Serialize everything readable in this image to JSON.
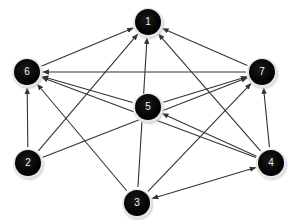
{
  "diagram": {
    "type": "directed-graph",
    "colors": {
      "node_fill": "#000000",
      "node_label": "#ffffff",
      "node_ring": "#e0e0e0",
      "edge": "#333333",
      "background": "#ffffff"
    },
    "nodes": [
      {
        "id": "1",
        "label": "1",
        "x": 148,
        "y": 22
      },
      {
        "id": "2",
        "label": "2",
        "x": 28,
        "y": 163
      },
      {
        "id": "3",
        "label": "3",
        "x": 137,
        "y": 203
      },
      {
        "id": "4",
        "label": "4",
        "x": 271,
        "y": 163
      },
      {
        "id": "5",
        "label": "5",
        "x": 148,
        "y": 107
      },
      {
        "id": "6",
        "label": "6",
        "x": 27,
        "y": 72
      },
      {
        "id": "7",
        "label": "7",
        "x": 262,
        "y": 72
      }
    ],
    "edges": [
      {
        "from": "6",
        "to": "1"
      },
      {
        "from": "2",
        "to": "1"
      },
      {
        "from": "3",
        "to": "1"
      },
      {
        "from": "4",
        "to": "1"
      },
      {
        "from": "7",
        "to": "1"
      },
      {
        "from": "7",
        "to": "6"
      },
      {
        "from": "5",
        "to": "6"
      },
      {
        "from": "4",
        "to": "6"
      },
      {
        "from": "3",
        "to": "6"
      },
      {
        "from": "2",
        "to": "6"
      },
      {
        "from": "5",
        "to": "7"
      },
      {
        "from": "2",
        "to": "7"
      },
      {
        "from": "3",
        "to": "7"
      },
      {
        "from": "4",
        "to": "7"
      },
      {
        "from": "4",
        "to": "5"
      },
      {
        "from": "3",
        "to": "4",
        "bidirectional": true
      }
    ]
  }
}
